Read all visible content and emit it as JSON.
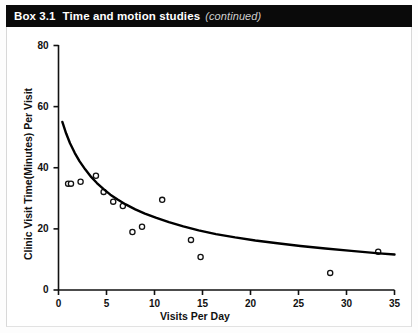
{
  "header": {
    "box_number": "Box 3.1",
    "title": "Time and motion studies",
    "continued": "(continued)"
  },
  "colors": {
    "header_bg": "#0a0a0a",
    "header_text": "#ffffff",
    "continued_text": "#cfcfcf",
    "axis": "#111111",
    "curve": "#000000",
    "marker_stroke": "#111111",
    "marker_fill": "#ffffff",
    "page_bg": "#ffffff"
  },
  "chart_data": {
    "type": "scatter",
    "title": "",
    "xlabel": "Visits Per Day",
    "ylabel": "Clinic Visit Time(Minutes) Per Visit",
    "xlim": [
      0,
      35
    ],
    "ylim": [
      0,
      80
    ],
    "xticks": [
      0,
      5,
      10,
      15,
      20,
      25,
      30,
      35
    ],
    "yticks": [
      0,
      20,
      40,
      60,
      80
    ],
    "xtick_labels": [
      "0",
      "5",
      "10",
      "15",
      "20",
      "25",
      "30",
      "35"
    ],
    "ytick_labels": [
      "0",
      "20",
      "40",
      "60",
      "80"
    ],
    "grid": false,
    "legend": false,
    "series": [
      {
        "name": "Observed clinics",
        "marker": "open-circle",
        "x": [
          1.0,
          1.3,
          2.3,
          3.9,
          4.7,
          5.7,
          6.7,
          7.7,
          8.7,
          10.8,
          13.8,
          14.8,
          28.3,
          33.3
        ],
        "y": [
          34.8,
          34.8,
          35.4,
          37.4,
          32.1,
          28.9,
          27.5,
          19.0,
          20.7,
          29.5,
          16.4,
          10.8,
          5.6,
          12.5
        ]
      },
      {
        "name": "Fitted curve",
        "type": "line",
        "x": [
          0.4,
          0.8,
          1.2,
          1.7,
          2.2,
          2.8,
          3.4,
          4.0,
          4.7,
          5.4,
          6.2,
          7.0,
          8.0,
          9.0,
          10.2,
          11.5,
          13.0,
          14.6,
          16.4,
          18.4,
          20.5,
          22.8,
          25.2,
          27.8,
          30.5,
          33.4,
          35.0
        ],
        "y": [
          55.0,
          51.2,
          48.0,
          44.8,
          42.1,
          39.4,
          37.0,
          35.0,
          33.0,
          31.2,
          29.5,
          28.0,
          26.4,
          25.0,
          23.6,
          22.2,
          20.8,
          19.5,
          18.3,
          17.2,
          16.2,
          15.3,
          14.4,
          13.6,
          12.8,
          12.0,
          11.6
        ]
      }
    ]
  }
}
